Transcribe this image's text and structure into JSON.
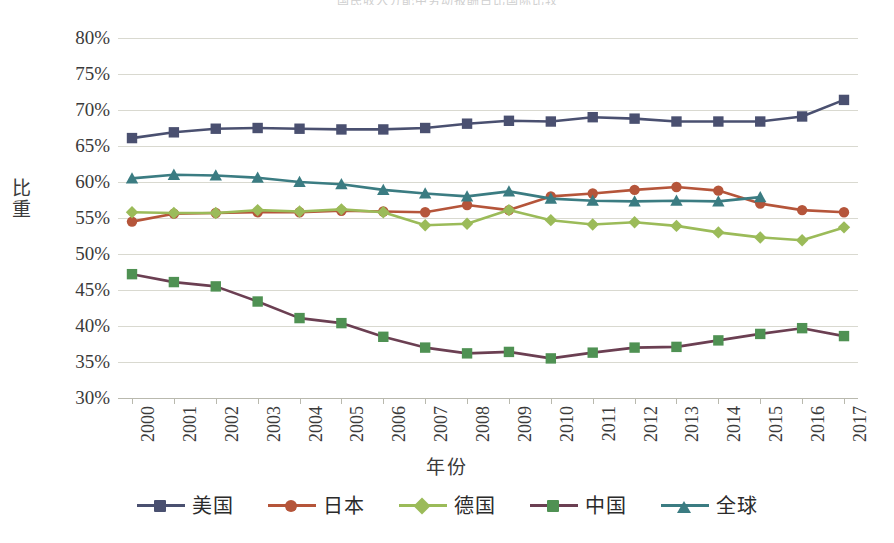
{
  "top_clipped_text": "国民收入分配中劳动报酬占比国际比较",
  "chart_data": {
    "type": "line",
    "title": "",
    "xlabel": "年份",
    "ylabel": "比重",
    "grid": true,
    "legend_position": "bottom",
    "ylim": [
      30,
      80
    ],
    "ytick_step": 5,
    "ytick_labels": [
      "80%",
      "75%",
      "70%",
      "65%",
      "60%",
      "55%",
      "50%",
      "45%",
      "40%",
      "35%",
      "30%"
    ],
    "ytick_values": [
      80,
      75,
      70,
      65,
      60,
      55,
      50,
      45,
      40,
      35,
      30
    ],
    "categories": [
      "2000",
      "2001",
      "2002",
      "2003",
      "2004",
      "2005",
      "2006",
      "2007",
      "2008",
      "2009",
      "2010",
      "2011",
      "2012",
      "2013",
      "2014",
      "2015",
      "2016",
      "2017"
    ],
    "series": [
      {
        "name": "美国",
        "color": "#4a5070",
        "marker": "square",
        "values": [
          66.1,
          66.9,
          67.4,
          67.5,
          67.4,
          67.3,
          67.3,
          67.5,
          68.1,
          68.5,
          68.4,
          69.0,
          68.8,
          68.4,
          68.4,
          68.4,
          69.1,
          71.4
        ]
      },
      {
        "name": "日本",
        "color": "#b5553a",
        "marker": "circle",
        "values": [
          54.5,
          55.6,
          55.7,
          55.8,
          55.8,
          56.0,
          55.9,
          55.8,
          56.8,
          56.1,
          58.0,
          58.4,
          58.9,
          59.3,
          58.8,
          57.0,
          56.1,
          55.8
        ]
      },
      {
        "name": "德国",
        "color": "#9bbb59",
        "marker": "diamond",
        "values": [
          55.8,
          55.7,
          55.7,
          56.1,
          55.9,
          56.2,
          55.8,
          54.0,
          54.2,
          56.1,
          54.7,
          54.1,
          54.4,
          53.9,
          53.0,
          52.3,
          51.9,
          53.7
        ]
      },
      {
        "name": "中国",
        "color": "#4f9153",
        "marker": "square",
        "values": [
          47.2,
          46.1,
          45.5,
          43.4,
          41.1,
          40.4,
          38.5,
          37.0,
          36.2,
          36.4,
          35.5,
          36.3,
          37.0,
          37.1,
          38.0,
          38.9,
          39.7,
          38.6
        ]
      },
      {
        "name": "全球",
        "color": "#3b7c82",
        "marker": "triangle",
        "values": [
          60.5,
          61.0,
          60.9,
          60.6,
          60.0,
          59.7,
          58.9,
          58.4,
          58.0,
          58.7,
          57.7,
          57.4,
          57.3,
          57.4,
          57.3,
          57.9,
          null,
          null
        ]
      }
    ]
  },
  "legend": {
    "items": [
      {
        "label": "美国",
        "color": "#4a5070",
        "marker": "square"
      },
      {
        "label": "日本",
        "color": "#b5553a",
        "marker": "circle"
      },
      {
        "label": "德国",
        "color": "#9bbb59",
        "marker": "diamond"
      },
      {
        "label": "中国",
        "color": "#4f9153",
        "marker": "square"
      },
      {
        "label": "全球",
        "color": "#3b7c82",
        "marker": "triangle"
      }
    ]
  }
}
